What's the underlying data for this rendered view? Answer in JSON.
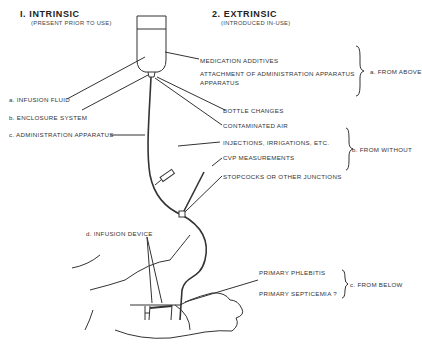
{
  "headers": {
    "intrinsic": {
      "title": "I. INTRINSIC",
      "subtitle": "(PRESENT PRIOR TO USE)"
    },
    "extrinsic": {
      "title": "2. EXTRINSIC",
      "subtitle": "(INTRODUCED IN-USE)"
    }
  },
  "intrinsic_labels": {
    "a": "a. INFUSION FLUID",
    "b": "b. ENCLOSURE SYSTEM",
    "c": "c. ADMINISTRATION APPARATUS",
    "d": "d. INFUSION DEVICE"
  },
  "extrinsic_labels": {
    "medication": "MEDICATION ADDITIVES",
    "attachment_1": "ATTACHMENT OF ADMINISTRATION APPARATUS",
    "attachment_2": "APPARATUS",
    "bottle": "BOTTLE CHANGES",
    "air": "CONTAMINATED AIR",
    "injections": "INJECTIONS, IRRIGATIONS, ETC.",
    "cvp": "CVP MEASUREMENTS",
    "stopcocks": "STOPCOCKS OR OTHER JUNCTIONS",
    "phlebitis": "PRIMARY PHLEBITIS",
    "septicemia": "PRIMARY SEPTICEMIA ?"
  },
  "groups": {
    "above": "a. FROM ABOVE",
    "without": "b. FROM WITHOUT",
    "below": "c. FROM BELOW"
  }
}
